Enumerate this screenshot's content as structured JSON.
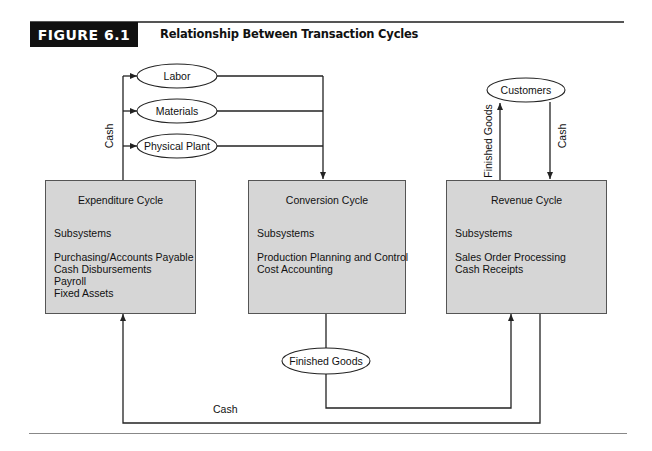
{
  "header": {
    "figure_label": "FIGURE 6.1",
    "figure_title": "Relationship Between Transaction Cycles"
  },
  "inputs": {
    "labor": "Labor",
    "materials": "Materials",
    "physical_plant": "Physical Plant",
    "cash_label": "Cash"
  },
  "customers": {
    "label": "Customers",
    "finished_goods_label": "Finished Goods",
    "cash_label": "Cash"
  },
  "cycles": [
    {
      "title": "Expenditure Cycle",
      "subsystems_label": "Subsystems",
      "subsystems": [
        "Purchasing/Accounts Payable",
        "Cash Disbursements",
        "Payroll",
        "Fixed Assets"
      ]
    },
    {
      "title": "Conversion Cycle",
      "subsystems_label": "Subsystems",
      "subsystems": [
        "Production Planning and Control",
        "Cost Accounting"
      ]
    },
    {
      "title": "Revenue Cycle",
      "subsystems_label": "Subsystems",
      "subsystems": [
        "Sales Order Processing",
        "Cash Receipts"
      ]
    }
  ],
  "bottom_flows": {
    "finished_goods": "Finished Goods",
    "cash": "Cash"
  },
  "colors": {
    "box_fill": "#d6d6d6",
    "line": "#222222",
    "label_bg": "#111111"
  }
}
